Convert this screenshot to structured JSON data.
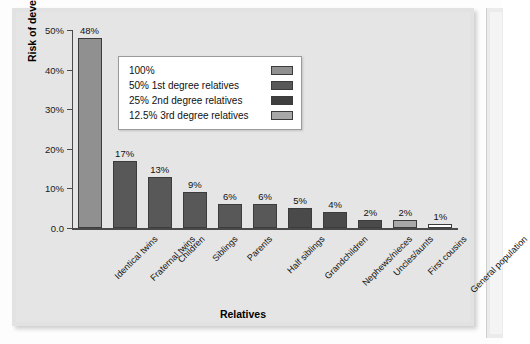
{
  "chart_data": {
    "type": "bar",
    "title": "",
    "xlabel": "Relatives",
    "ylabel": "Risk of developing schizophrenia",
    "ylim": [
      0,
      50
    ],
    "ytick_labels": [
      "50%",
      "40%",
      "30%",
      "20%",
      "10%",
      "0.0"
    ],
    "ytick_values": [
      50,
      40,
      30,
      20,
      10,
      0
    ],
    "grid": false,
    "legend_position": "upper-center",
    "categories": [
      "Identical twins",
      "Fraternal twins",
      "Children",
      "Siblings",
      "Parents",
      "Half siblings",
      "Grandchildren",
      "Nephews/nieces",
      "Uncles/aunts",
      "First cousins",
      "General population"
    ],
    "values": [
      48,
      17,
      13,
      9,
      6,
      6,
      5,
      4,
      2,
      2,
      1
    ],
    "value_labels": [
      "48%",
      "17%",
      "13%",
      "9%",
      "6%",
      "6%",
      "5%",
      "4%",
      "2%",
      "2%",
      "1%"
    ],
    "bar_group": [
      0,
      1,
      1,
      1,
      1,
      1,
      2,
      2,
      2,
      3,
      4
    ],
    "legend": [
      {
        "label": "100%",
        "color": "#909090"
      },
      {
        "label": "50% 1st degree relatives",
        "color": "#585858"
      },
      {
        "label": "25% 2nd degree relatives",
        "color": "#3f3f3f"
      },
      {
        "label": "12.5% 3rd degree relatives",
        "color": "#a8a8a8"
      }
    ],
    "group_colors": [
      "#909090",
      "#585858",
      "#4a4a4a",
      "#a8a8a8",
      "#ffffff"
    ]
  }
}
